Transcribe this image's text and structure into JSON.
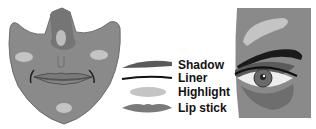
{
  "legend": {
    "items": [
      {
        "label": "Shadow",
        "swatch": "shadow"
      },
      {
        "label": "Liner",
        "swatch": "liner"
      },
      {
        "label": "Highlight",
        "swatch": "highlight"
      },
      {
        "label": "Lip stick",
        "swatch": "lipstick"
      }
    ]
  },
  "colors": {
    "skin": "#8a8a8a",
    "skin_dark": "#6e6e6e",
    "highlight": "#c4c4c4",
    "shadow": "#5a5a5a",
    "liner": "#111111",
    "lip": "#7a7a7a",
    "background": "#ffffff"
  }
}
